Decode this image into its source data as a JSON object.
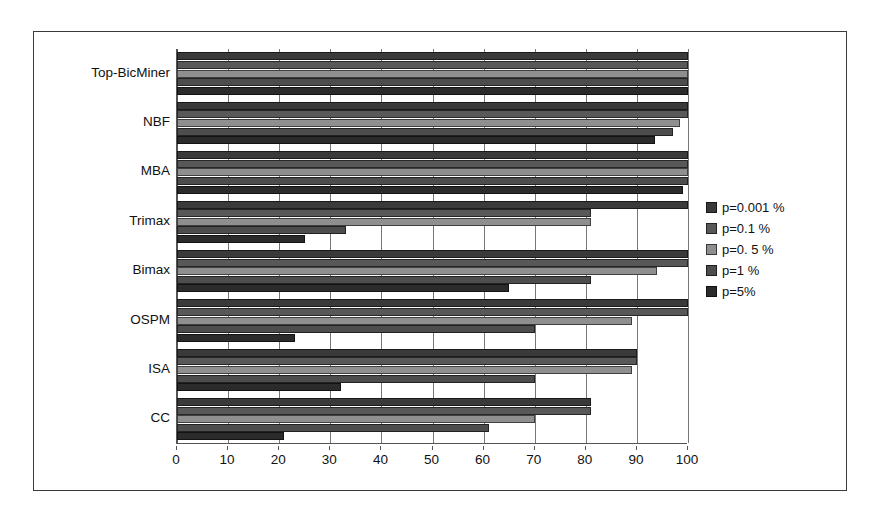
{
  "chart_data": {
    "type": "bar",
    "orientation": "horizontal",
    "title": "",
    "xlabel": "",
    "ylabel": "",
    "xlim": [
      0,
      100
    ],
    "xticks": [
      0,
      10,
      20,
      30,
      40,
      50,
      60,
      70,
      80,
      90,
      100
    ],
    "grid": true,
    "legend_position": "right",
    "categories": [
      "Top-BicMiner",
      "NBF",
      "MBA",
      "Trimax",
      "Bimax",
      "OSPM",
      "ISA",
      "CC"
    ],
    "series": [
      {
        "name": "p=0.001 %",
        "color": "#3a3a3a",
        "values": [
          100,
          100,
          100,
          100,
          100,
          100,
          90,
          81
        ]
      },
      {
        "name": "p=0.1 %",
        "color": "#585858",
        "values": [
          100,
          100,
          100,
          81,
          100,
          100,
          90,
          81
        ]
      },
      {
        "name": "p=0. 5 %",
        "color": "#8f8f8f",
        "values": [
          100,
          98.5,
          100,
          81,
          94,
          89,
          89,
          70
        ]
      },
      {
        "name": "p=1 %",
        "color": "#4d4d4d",
        "values": [
          100,
          97,
          100,
          33,
          81,
          70,
          70,
          61
        ]
      },
      {
        "name": "p=5%",
        "color": "#2b2b2b",
        "values": [
          100,
          93.5,
          99,
          25,
          65,
          23,
          32,
          21
        ]
      }
    ]
  },
  "legend": {
    "items": [
      {
        "label": "p=0.001 %",
        "color": "#3a3a3a"
      },
      {
        "label": "p=0.1 %",
        "color": "#585858"
      },
      {
        "label": "p=0. 5 %",
        "color": "#8f8f8f"
      },
      {
        "label": "p=1 %",
        "color": "#4d4d4d"
      },
      {
        "label": "p=5%",
        "color": "#2b2b2b"
      }
    ]
  }
}
